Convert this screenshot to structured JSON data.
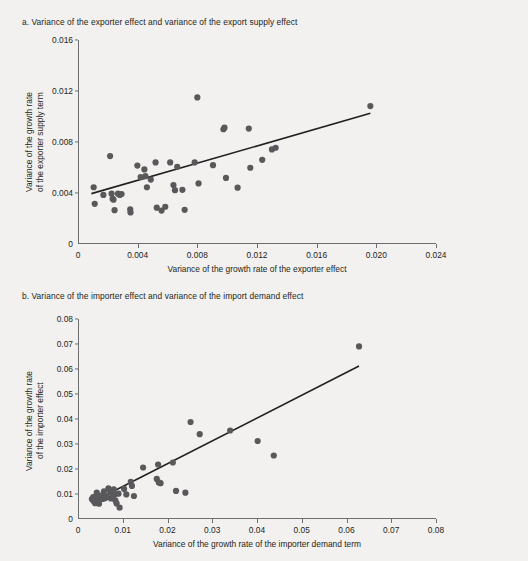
{
  "figure": {
    "background_color": "#f2f1ef",
    "point_color": "#59595b",
    "line_color": "#231f20",
    "axis_color": "#6d6e71"
  },
  "chart_data": [
    {
      "id": "panel-a",
      "type": "scatter",
      "title": "a. Variance of the exporter effect and variance of the export supply effect",
      "xlabel": "Variance of the growth rate of the exporter effect",
      "ylabel": "Variance of the growth rate\nof the exporter supply term",
      "xlim": [
        0,
        0.024
      ],
      "ylim": [
        0,
        0.016
      ],
      "xticks": [
        0,
        0.004,
        0.008,
        0.012,
        0.016,
        0.02,
        0.024
      ],
      "xticklabels": [
        "0",
        "0.004",
        "0.008",
        "0.012",
        "0.016",
        "0.020",
        "0.024"
      ],
      "yticks": [
        0,
        0.004,
        0.008,
        0.012,
        0.016
      ],
      "yticklabels": [
        "0",
        "0.004",
        "0.008",
        "0.012",
        "0.016"
      ],
      "grid": false,
      "legend": "none",
      "trendline": {
        "x0": 0.0009,
        "y0": 0.00395,
        "x1": 0.0196,
        "y1": 0.01025
      },
      "points": [
        [
          0.00105,
          0.00445
        ],
        [
          0.00112,
          0.00315
        ],
        [
          0.0017,
          0.00385
        ],
        [
          0.00215,
          0.0069
        ],
        [
          0.00225,
          0.00395
        ],
        [
          0.00232,
          0.00355
        ],
        [
          0.00238,
          0.00348
        ],
        [
          0.00245,
          0.00265
        ],
        [
          0.00268,
          0.00395
        ],
        [
          0.0028,
          0.00385
        ],
        [
          0.00292,
          0.00392
        ],
        [
          0.0035,
          0.00272
        ],
        [
          0.00352,
          0.00248
        ],
        [
          0.00398,
          0.00615
        ],
        [
          0.0042,
          0.00525
        ],
        [
          0.00445,
          0.00585
        ],
        [
          0.00452,
          0.00532
        ],
        [
          0.00462,
          0.00445
        ],
        [
          0.00488,
          0.00505
        ],
        [
          0.0052,
          0.0064
        ],
        [
          0.00528,
          0.00285
        ],
        [
          0.0056,
          0.00262
        ],
        [
          0.00585,
          0.00292
        ],
        [
          0.00618,
          0.0064
        ],
        [
          0.0064,
          0.00462
        ],
        [
          0.0065,
          0.00422
        ],
        [
          0.00665,
          0.00605
        ],
        [
          0.007,
          0.00425
        ],
        [
          0.00715,
          0.00268
        ],
        [
          0.00782,
          0.0064
        ],
        [
          0.008,
          0.0115
        ],
        [
          0.00808,
          0.00475
        ],
        [
          0.00905,
          0.00618
        ],
        [
          0.00975,
          0.009
        ],
        [
          0.00982,
          0.00912
        ],
        [
          0.00992,
          0.00518
        ],
        [
          0.0107,
          0.00442
        ],
        [
          0.01145,
          0.00905
        ],
        [
          0.01155,
          0.00598
        ],
        [
          0.01235,
          0.0066
        ],
        [
          0.013,
          0.00742
        ],
        [
          0.01325,
          0.00755
        ],
        [
          0.0196,
          0.01082
        ]
      ]
    },
    {
      "id": "panel-b",
      "type": "scatter",
      "title": "b. Variance of the importer effect and variance of the import demand effect",
      "xlabel": "Variance of the growth rate of the importer demand term",
      "ylabel": "Variance of the growth rate\nof the importer effect",
      "xlim": [
        0,
        0.08
      ],
      "ylim": [
        0,
        0.08
      ],
      "xticks": [
        0,
        0.01,
        0.02,
        0.03,
        0.04,
        0.05,
        0.06,
        0.07,
        0.08
      ],
      "xticklabels": [
        "0",
        "0.01",
        "0.02",
        "0.03",
        "0.04",
        "0.05",
        "0.06",
        "0.07",
        "0.08"
      ],
      "yticks": [
        0,
        0.01,
        0.02,
        0.03,
        0.04,
        0.05,
        0.06,
        0.07,
        0.08
      ],
      "yticklabels": [
        "0",
        "0.01",
        "0.02",
        "0.03",
        "0.04",
        "0.05",
        "0.06",
        "0.07",
        "0.08"
      ],
      "grid": false,
      "legend": "none",
      "trendline": {
        "x0": 0.0032,
        "y0": 0.0068,
        "x1": 0.0628,
        "y1": 0.0612
      },
      "points": [
        [
          0.0031,
          0.008
        ],
        [
          0.0033,
          0.0076
        ],
        [
          0.0034,
          0.0088
        ],
        [
          0.00355,
          0.00705
        ],
        [
          0.00368,
          0.0083
        ],
        [
          0.00382,
          0.00635
        ],
        [
          0.00395,
          0.00905
        ],
        [
          0.00405,
          0.00755
        ],
        [
          0.0042,
          0.0106
        ],
        [
          0.00432,
          0.007
        ],
        [
          0.00448,
          0.0082
        ],
        [
          0.0047,
          0.00615
        ],
        [
          0.0052,
          0.00935
        ],
        [
          0.00555,
          0.00805
        ],
        [
          0.0058,
          0.01105
        ],
        [
          0.00612,
          0.00838
        ],
        [
          0.0064,
          0.00905
        ],
        [
          0.0068,
          0.0123
        ],
        [
          0.00705,
          0.01155
        ],
        [
          0.00735,
          0.0082
        ],
        [
          0.0076,
          0.01028
        ],
        [
          0.00782,
          0.00905
        ],
        [
          0.008,
          0.01185
        ],
        [
          0.00815,
          0.00985
        ],
        [
          0.00835,
          0.00742
        ],
        [
          0.00862,
          0.00625
        ],
        [
          0.00905,
          0.01015
        ],
        [
          0.0093,
          0.00452
        ],
        [
          0.0103,
          0.01205
        ],
        [
          0.0108,
          0.00985
        ],
        [
          0.0118,
          0.0149
        ],
        [
          0.01205,
          0.01325
        ],
        [
          0.0125,
          0.0092
        ],
        [
          0.01455,
          0.0206
        ],
        [
          0.0176,
          0.01605
        ],
        [
          0.0179,
          0.0218
        ],
        [
          0.01805,
          0.01465
        ],
        [
          0.01845,
          0.01435
        ],
        [
          0.0212,
          0.0226
        ],
        [
          0.0219,
          0.01125
        ],
        [
          0.024,
          0.01052
        ],
        [
          0.02515,
          0.0388
        ],
        [
          0.0272,
          0.03395
        ],
        [
          0.034,
          0.0354
        ],
        [
          0.04015,
          0.0312
        ],
        [
          0.04375,
          0.0254
        ],
        [
          0.0628,
          0.06905
        ]
      ]
    }
  ]
}
